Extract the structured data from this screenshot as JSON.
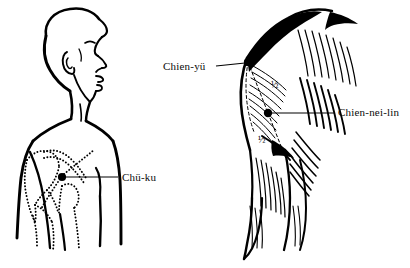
{
  "plate": {
    "title": "",
    "background_color": "#ffffff",
    "ink_color": "#000000",
    "style": "black-and-white line drawing"
  },
  "figures": [
    {
      "id": "left-figure",
      "name": "male-profile-torso",
      "description": "Man in right profile, head and upper torso, with dotted skeletal outlines of clavicle, scapula and ribs",
      "points": [
        {
          "label": "Chü-ku",
          "marker_x": 62,
          "marker_y": 177,
          "label_x": 122,
          "label_y": 181
        }
      ]
    },
    {
      "id": "right-figure",
      "name": "shoulder-musculature",
      "description": "Shoulder and upper arm with hatched muscle fibres of deltoid and trapezius, dashed proportion triangle",
      "points": [
        {
          "label": "Chien-yü",
          "marker_x": 248,
          "marker_y": 62,
          "label_x": 163,
          "label_y": 70
        },
        {
          "label": "Chien-nei-lin",
          "marker_x": 283,
          "marker_y": 113,
          "label_x": 338,
          "label_y": 116
        }
      ],
      "proportion_marks": [
        {
          "text": "½",
          "x": 271,
          "y": 88
        },
        {
          "text": "½",
          "x": 264,
          "y": 140
        }
      ]
    }
  ],
  "labels": {
    "chu_ku": "Chü-ku",
    "chien_yu": "Chien-yü",
    "chien_nei_lin": "Chien-nei-lin",
    "half_upper": "½",
    "half_lower": "½"
  }
}
